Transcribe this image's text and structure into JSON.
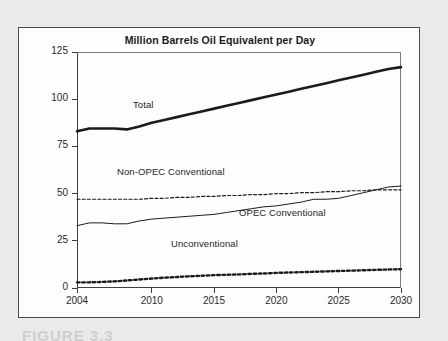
{
  "figure": {
    "title": "Million Barrels Oil Equivalent per Day",
    "caption_sliver": "FIGURE 3.3"
  },
  "axes": {
    "y_ticks": [
      "0",
      "25",
      "50",
      "75",
      "100",
      "125"
    ],
    "x_ticks": [
      "2004",
      "2010",
      "2015",
      "2020",
      "2025",
      "2030"
    ]
  },
  "series_labels": {
    "total": "Total",
    "non_opec": "Non-OPEC Conventional",
    "opec": "OPEC Conventional",
    "unconventional": "Unconventional"
  },
  "colors": {
    "line": "#1b1b1b",
    "frame": "#4b4b4b",
    "axis": "#3f3f3f",
    "page_background": "#eceae9",
    "figure_background": "#fdfdfd"
  },
  "chart_data": {
    "type": "line",
    "title": "Million Barrels Oil Equivalent per Day",
    "xlabel": "",
    "ylabel": "Million Barrels Oil Equivalent per Day",
    "xlim": [
      2004,
      2030
    ],
    "ylim": [
      0,
      125
    ],
    "xticks": [
      2004,
      2010,
      2015,
      2020,
      2025,
      2030
    ],
    "yticks": [
      0,
      25,
      50,
      75,
      100,
      125
    ],
    "grid": false,
    "legend": "inline-labels",
    "x": [
      2004,
      2005,
      2006,
      2007,
      2008,
      2009,
      2010,
      2011,
      2012,
      2013,
      2014,
      2015,
      2016,
      2017,
      2018,
      2019,
      2020,
      2021,
      2022,
      2023,
      2024,
      2025,
      2026,
      2027,
      2028,
      2029,
      2030
    ],
    "series": [
      {
        "name": "Total",
        "style": "thick-solid",
        "values": [
          83,
          84.5,
          84.5,
          84.5,
          84,
          85.5,
          87.5,
          89,
          90.5,
          92,
          93.5,
          95,
          96.5,
          98,
          99.5,
          101,
          102.5,
          104,
          105.5,
          107,
          108.5,
          110,
          111.5,
          113,
          114.5,
          116,
          117
        ]
      },
      {
        "name": "Non-OPEC Conventional",
        "style": "fine-dashed",
        "values": [
          47,
          47,
          47,
          47,
          47,
          47,
          47.5,
          47.5,
          48,
          48,
          48.5,
          48.5,
          49,
          49,
          49.5,
          49.5,
          50,
          50,
          50.5,
          50.5,
          51,
          51,
          51.5,
          51.5,
          52,
          52,
          52
        ]
      },
      {
        "name": "OPEC Conventional",
        "style": "thin-solid",
        "values": [
          33,
          34.5,
          34.5,
          34,
          34,
          35.5,
          36.5,
          37,
          37.5,
          38,
          38.5,
          39,
          40,
          41,
          42,
          43,
          43.5,
          44.5,
          45.5,
          47,
          47,
          47.5,
          49,
          50.5,
          52,
          53.5,
          54
        ]
      },
      {
        "name": "Unconventional",
        "style": "thick-dotted",
        "values": [
          3,
          3,
          3.2,
          3.5,
          4,
          4.5,
          5,
          5.5,
          5.8,
          6.2,
          6.5,
          6.8,
          7,
          7.2,
          7.5,
          7.7,
          8,
          8.2,
          8.4,
          8.6,
          8.8,
          9,
          9.2,
          9.4,
          9.6,
          9.8,
          10
        ]
      }
    ]
  }
}
